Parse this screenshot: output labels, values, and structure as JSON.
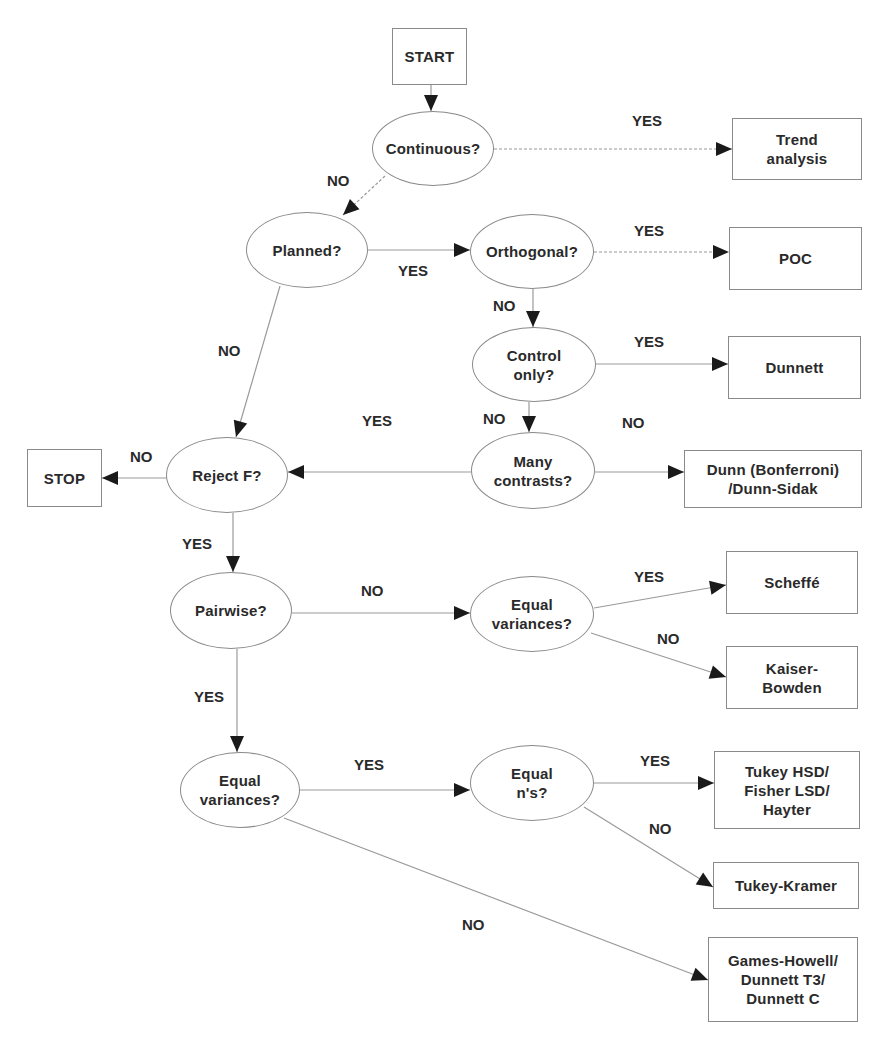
{
  "diagram": {
    "line_color": "#9a9a9a",
    "arrow_color": "#1a1a1a",
    "border_color": "#8a8a8a",
    "text_color": "#2a2a2a",
    "nodes": [
      {
        "id": "start",
        "type": "box",
        "label": "START",
        "x": 392,
        "y": 28,
        "w": 75,
        "h": 57
      },
      {
        "id": "continuous",
        "type": "ellipse",
        "label": "Continuous?",
        "x": 372,
        "y": 111,
        "w": 122,
        "h": 75
      },
      {
        "id": "trend",
        "type": "box",
        "label": "Trend\nanalysis",
        "x": 732,
        "y": 118,
        "w": 130,
        "h": 62
      },
      {
        "id": "planned",
        "type": "ellipse",
        "label": "Planned?",
        "x": 246,
        "y": 212,
        "w": 122,
        "h": 76
      },
      {
        "id": "orthogonal",
        "type": "ellipse",
        "label": "Orthogonal?",
        "x": 470,
        "y": 214,
        "w": 124,
        "h": 75
      },
      {
        "id": "poc",
        "type": "box",
        "label": "POC",
        "x": 729,
        "y": 227,
        "w": 133,
        "h": 63
      },
      {
        "id": "control",
        "type": "ellipse",
        "label": "Control\nonly?",
        "x": 472,
        "y": 327,
        "w": 124,
        "h": 75
      },
      {
        "id": "dunnett",
        "type": "box",
        "label": "Dunnett",
        "x": 728,
        "y": 336,
        "w": 133,
        "h": 63
      },
      {
        "id": "rejectf",
        "type": "ellipse",
        "label": "Reject F?",
        "x": 166,
        "y": 437,
        "w": 122,
        "h": 76
      },
      {
        "id": "stop",
        "type": "box",
        "label": "STOP",
        "x": 27,
        "y": 449,
        "w": 75,
        "h": 58
      },
      {
        "id": "many",
        "type": "ellipse",
        "label": "Many\ncontrasts?",
        "x": 471,
        "y": 432,
        "w": 124,
        "h": 77
      },
      {
        "id": "dunn",
        "type": "box",
        "label": "Dunn (Bonferroni)\n/Dunn-Sidak",
        "x": 684,
        "y": 450,
        "w": 178,
        "h": 58
      },
      {
        "id": "pairwise",
        "type": "ellipse",
        "label": "Pairwise?",
        "x": 170,
        "y": 572,
        "w": 122,
        "h": 77
      },
      {
        "id": "eqvar1",
        "type": "ellipse",
        "label": "Equal\nvariances?",
        "x": 470,
        "y": 576,
        "w": 124,
        "h": 76
      },
      {
        "id": "scheffe",
        "type": "box",
        "label": "Scheffé",
        "x": 726,
        "y": 551,
        "w": 132,
        "h": 63
      },
      {
        "id": "kaiser",
        "type": "box",
        "label": "Kaiser-\nBowden",
        "x": 726,
        "y": 646,
        "w": 132,
        "h": 63
      },
      {
        "id": "eqvar2",
        "type": "ellipse",
        "label": "Equal\nvariances?",
        "x": 180,
        "y": 752,
        "w": 120,
        "h": 76
      },
      {
        "id": "eqn",
        "type": "ellipse",
        "label": "Equal\nn's?",
        "x": 470,
        "y": 745,
        "w": 124,
        "h": 76
      },
      {
        "id": "tukeyhsd",
        "type": "box",
        "label": "Tukey HSD/\nFisher LSD/\nHayter",
        "x": 714,
        "y": 751,
        "w": 146,
        "h": 78
      },
      {
        "id": "tukeykramer",
        "type": "box",
        "label": "Tukey-Kramer",
        "x": 713,
        "y": 862,
        "w": 146,
        "h": 47
      },
      {
        "id": "games",
        "type": "box",
        "label": "Games-Howell/\nDunnett T3/\nDunnett C",
        "x": 708,
        "y": 937,
        "w": 150,
        "h": 85
      }
    ],
    "edges": [
      {
        "from": "start",
        "to": "continuous",
        "label": "",
        "points": [
          [
            431,
            85
          ],
          [
            431,
            111
          ]
        ],
        "dashed": false
      },
      {
        "from": "continuous",
        "to": "trend",
        "label": "YES",
        "label_x": 632,
        "label_y": 112,
        "points": [
          [
            494,
            149
          ],
          [
            732,
            149
          ]
        ],
        "dashed": true
      },
      {
        "from": "continuous",
        "to": "planned",
        "label": "NO",
        "label_x": 327,
        "label_y": 172,
        "points": [
          [
            385,
            176
          ],
          [
            343,
            215
          ]
        ],
        "dashed": true
      },
      {
        "from": "planned",
        "to": "orthogonal",
        "label": "YES",
        "label_x": 398,
        "label_y": 262,
        "points": [
          [
            368,
            250
          ],
          [
            470,
            250
          ]
        ],
        "dashed": false
      },
      {
        "from": "orthogonal",
        "to": "poc",
        "label": "YES",
        "label_x": 634,
        "label_y": 222,
        "points": [
          [
            594,
            252
          ],
          [
            729,
            252
          ]
        ],
        "dashed": true
      },
      {
        "from": "orthogonal",
        "to": "control",
        "label": "NO",
        "label_x": 493,
        "label_y": 297,
        "points": [
          [
            533,
            289
          ],
          [
            533,
            327
          ]
        ],
        "dashed": false
      },
      {
        "from": "planned",
        "to": "rejectf",
        "label": "NO",
        "label_x": 218,
        "label_y": 342,
        "points": [
          [
            280,
            286
          ],
          [
            236,
            437
          ]
        ],
        "dashed": false
      },
      {
        "from": "control",
        "to": "dunnett",
        "label": "YES",
        "label_x": 634,
        "label_y": 333,
        "points": [
          [
            596,
            364
          ],
          [
            728,
            364
          ]
        ],
        "dashed": false
      },
      {
        "from": "control",
        "to": "many",
        "label": "NO",
        "label_x": 483,
        "label_y": 410,
        "points": [
          [
            529,
            402
          ],
          [
            529,
            432
          ]
        ],
        "dashed": false
      },
      {
        "from": "many",
        "to": "rejectf",
        "label": "YES",
        "label_x": 362,
        "label_y": 412,
        "points": [
          [
            471,
            472
          ],
          [
            288,
            472
          ]
        ],
        "dashed": false
      },
      {
        "from": "many",
        "to": "dunn",
        "label": "NO",
        "label_x": 622,
        "label_y": 414,
        "points": [
          [
            595,
            472
          ],
          [
            684,
            472
          ]
        ],
        "dashed": false
      },
      {
        "from": "rejectf",
        "to": "stop",
        "label": "NO",
        "label_x": 130,
        "label_y": 448,
        "points": [
          [
            166,
            478
          ],
          [
            102,
            478
          ]
        ],
        "dashed": false
      },
      {
        "from": "rejectf",
        "to": "pairwise",
        "label": "YES",
        "label_x": 182,
        "label_y": 535,
        "points": [
          [
            233,
            513
          ],
          [
            233,
            572
          ]
        ],
        "dashed": false
      },
      {
        "from": "pairwise",
        "to": "eqvar1",
        "label": "NO",
        "label_x": 361,
        "label_y": 582,
        "points": [
          [
            292,
            613
          ],
          [
            470,
            613
          ]
        ],
        "dashed": false
      },
      {
        "from": "eqvar1",
        "to": "scheffe",
        "label": "YES",
        "label_x": 634,
        "label_y": 568,
        "points": [
          [
            594,
            608
          ],
          [
            726,
            585
          ]
        ],
        "dashed": false
      },
      {
        "from": "eqvar1",
        "to": "kaiser",
        "label": "NO",
        "label_x": 657,
        "label_y": 630,
        "points": [
          [
            591,
            633
          ],
          [
            726,
            677
          ]
        ],
        "dashed": false
      },
      {
        "from": "pairwise",
        "to": "eqvar2",
        "label": "YES",
        "label_x": 194,
        "label_y": 688,
        "points": [
          [
            237,
            649
          ],
          [
            237,
            752
          ]
        ],
        "dashed": false
      },
      {
        "from": "eqvar2",
        "to": "eqn",
        "label": "YES",
        "label_x": 354,
        "label_y": 756,
        "points": [
          [
            300,
            790
          ],
          [
            470,
            790
          ]
        ],
        "dashed": false
      },
      {
        "from": "eqn",
        "to": "tukeyhsd",
        "label": "YES",
        "label_x": 640,
        "label_y": 752,
        "points": [
          [
            594,
            783
          ],
          [
            714,
            783
          ]
        ],
        "dashed": false
      },
      {
        "from": "eqn",
        "to": "tukeykramer",
        "label": "NO",
        "label_x": 649,
        "label_y": 820,
        "points": [
          [
            584,
            807
          ],
          [
            713,
            887
          ]
        ],
        "dashed": false
      },
      {
        "from": "eqvar2",
        "to": "games",
        "label": "NO",
        "label_x": 462,
        "label_y": 916,
        "points": [
          [
            284,
            818
          ],
          [
            708,
            980
          ]
        ],
        "dashed": false
      }
    ]
  }
}
